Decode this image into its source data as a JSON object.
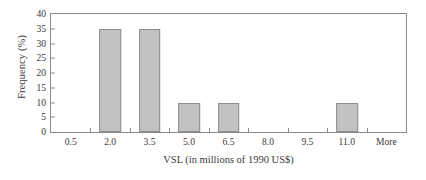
{
  "chart_data": {
    "type": "bar",
    "title": "",
    "xlabel": "VSL (in millions of 1990 US$)",
    "ylabel": "Frequency (%)",
    "categories": [
      "0.5",
      "2.0",
      "3.5",
      "5.0",
      "6.5",
      "8.0",
      "9.5",
      "11.0",
      "More"
    ],
    "values": [
      0,
      35,
      35,
      10,
      10,
      0,
      0,
      10,
      0
    ],
    "ylim": [
      0,
      40
    ],
    "yticks": [
      0,
      5,
      10,
      15,
      20,
      25,
      30,
      35,
      40
    ],
    "ytick_labels": [
      "0",
      "5",
      "10",
      "15",
      "20",
      "25",
      "30",
      "35",
      "40"
    ],
    "grid": false,
    "legend": false,
    "bar_color": "#c2c2c2",
    "bar_border_color": "#8d8d8d",
    "axis_color": "#8a8a8a",
    "background": "#ffffff",
    "bar_relative_width": 0.55
  }
}
